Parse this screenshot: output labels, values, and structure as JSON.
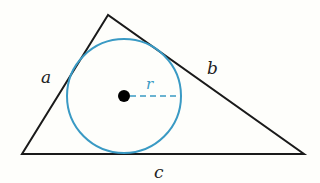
{
  "diagram": {
    "labels": {
      "side_a": "a",
      "side_b": "b",
      "side_c": "c",
      "radius": "r"
    },
    "colors": {
      "triangle": "#1a1a1a",
      "circle": "#3a9ac4",
      "center": "#000000",
      "background": "#fefefb"
    }
  }
}
